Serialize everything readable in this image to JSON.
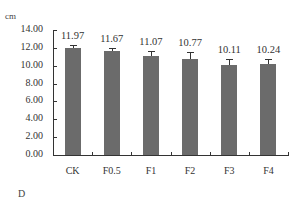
{
  "chart_data": {
    "type": "bar",
    "title": "",
    "panel_label": "D",
    "ylabel": "cm",
    "xlabel": "",
    "categories": [
      "CK",
      "F0.5",
      "F1",
      "F2",
      "F3",
      "F4"
    ],
    "values": [
      11.97,
      11.67,
      11.07,
      10.77,
      10.11,
      10.24
    ],
    "value_labels": [
      "11.97",
      "11.67",
      "11.07",
      "10.77",
      "10.11",
      "10.24"
    ],
    "error_bars": [
      0.35,
      0.3,
      0.6,
      0.75,
      0.6,
      0.55
    ],
    "ylim": [
      0,
      14
    ],
    "yticks": [
      "0.00",
      "2.00",
      "4.00",
      "6.00",
      "8.00",
      "10.00",
      "12.00",
      "14.00"
    ],
    "grid": false,
    "legend": null,
    "bar_color": "#6b6b6b"
  }
}
